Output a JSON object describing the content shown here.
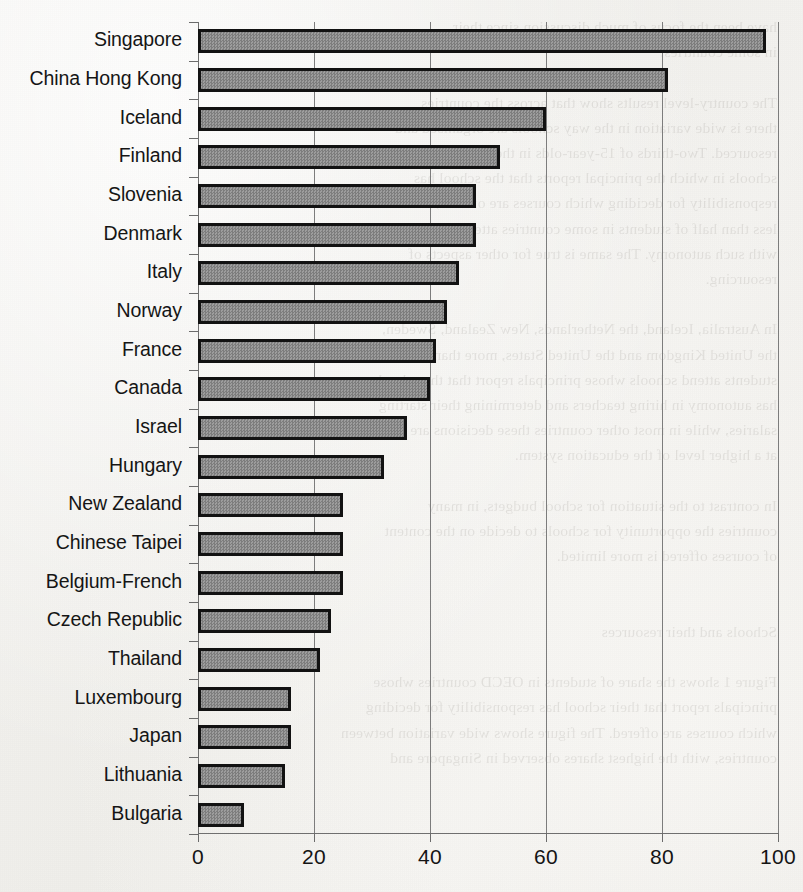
{
  "page": {
    "background_color": "#f2f1ee",
    "bleed_through_text": "have been the focus of much discussion since their\nin some countries.\n\nThe country-level results show that across the countries\nthere is wide variation in the way schools are organised and\nresourced. Two-thirds of 15-year-olds in the OECD area attend\nschools in which the principal reports that the school has\nresponsibility for deciding which courses are offered, while\nless than half of students in some countries attend schools\nwith such autonomy. The same is true for other aspects of\nresourcing.\n\nIn Australia, Iceland, the Netherlands, New Zealand, Sweden,\nthe United Kingdom and the United States, more than 80% of\nstudents attend schools whose principals report that the school\nhas autonomy in hiring teachers and determining their starting\nsalaries, while in most other countries these decisions are taken\nat a higher level of the education system.\n\nIn contrast to the situation for school budgets, in many\ncountries the opportunity for schools to decide on the content\nof courses offered is more limited.\n\n\nSchools and their resources\n\nFigure 1 shows the share of students in OECD countries whose\nprincipals report that their school has responsibility for deciding\nwhich courses are offered. The figure shows wide variation between\ncountries, with the highest shares observed in Singapore and"
  },
  "chart_data": {
    "type": "bar",
    "orientation": "horizontal",
    "title": "",
    "subtitle": "",
    "xlabel": "",
    "ylabel": "",
    "xlim": [
      0,
      100
    ],
    "ylim": null,
    "grid": true,
    "gridlines_axis": "x",
    "legend": null,
    "legend_position": "none",
    "xticks": [
      0,
      20,
      40,
      60,
      80,
      100
    ],
    "xtick_labels": [
      "0",
      "20",
      "40",
      "60",
      "80",
      "100"
    ],
    "bar_fill_color": "#8d8d8d",
    "bar_edge_color": "#121212",
    "axis_color": "#6f6f6f",
    "categories": [
      "Singapore",
      "China Hong Kong",
      "Iceland",
      "Finland",
      "Slovenia",
      "Denmark",
      "Italy",
      "Norway",
      "France",
      "Canada",
      "Israel",
      "Hungary",
      "New Zealand",
      "Chinese Taipei",
      "Belgium-French",
      "Czech Republic",
      "Thailand",
      "Luxembourg",
      "Japan",
      "Lithuania",
      "Bulgaria"
    ],
    "values": [
      98,
      81,
      60,
      52,
      48,
      48,
      45,
      43,
      41,
      40,
      36,
      32,
      25,
      25,
      25,
      23,
      21,
      16,
      16,
      15,
      8
    ]
  }
}
